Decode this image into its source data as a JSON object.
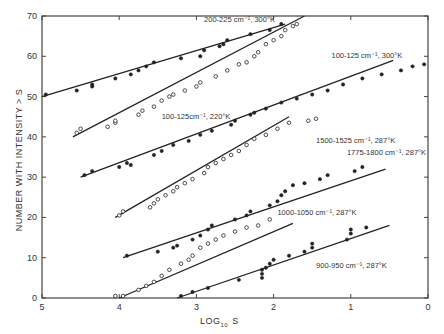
{
  "chart_data": {
    "type": "scatter",
    "title": "",
    "xlabel": "LOG₁₀ S",
    "xlabel_main": "LOG",
    "xlabel_sub": "10",
    "xlabel_tail": "S",
    "ylabel": "NUMBER WITH INTENSITY > S",
    "xlim": [
      5,
      0
    ],
    "ylim": [
      0,
      70
    ],
    "x_ticks": [
      5,
      4,
      3,
      2,
      1,
      0
    ],
    "y_ticks": [
      0,
      10,
      20,
      30,
      40,
      50,
      60,
      70
    ],
    "grid": false,
    "series": [
      {
        "name": "200-225 cm⁻¹, 300°K",
        "marker": "filled",
        "fit_line": [
          [
            5.0,
            50
          ],
          [
            1.85,
            68
          ]
        ],
        "points": [
          [
            4.95,
            50.5
          ],
          [
            4.55,
            51.5
          ],
          [
            4.35,
            52.5
          ],
          [
            4.35,
            53
          ],
          [
            4.05,
            54.5
          ],
          [
            3.85,
            55.5
          ],
          [
            3.75,
            56.5
          ],
          [
            3.65,
            57.5
          ],
          [
            3.55,
            58.5
          ],
          [
            3.2,
            59.5
          ],
          [
            2.95,
            60
          ],
          [
            2.9,
            61.5
          ],
          [
            2.7,
            62.5
          ],
          [
            2.65,
            63
          ],
          [
            2.6,
            64
          ],
          [
            2.3,
            65.5
          ],
          [
            2.05,
            66.5
          ],
          [
            1.9,
            68
          ]
        ],
        "label": {
          "text": "200-225 cm⁻¹, 300°K",
          "x": 2.9,
          "y": 68.5
        }
      },
      {
        "name": "100-125 cm⁻¹, 300°K",
        "marker": "open",
        "fit_line": [
          [
            4.6,
            40
          ],
          [
            1.6,
            70
          ]
        ],
        "points": [
          [
            4.55,
            41
          ],
          [
            4.5,
            42
          ],
          [
            4.15,
            42.5
          ],
          [
            4.05,
            43.5
          ],
          [
            4.05,
            44
          ],
          [
            3.75,
            45.5
          ],
          [
            3.7,
            46.5
          ],
          [
            3.55,
            47.5
          ],
          [
            3.45,
            49
          ],
          [
            3.35,
            50
          ],
          [
            3.3,
            50.5
          ],
          [
            3.15,
            51.5
          ],
          [
            3.0,
            52.5
          ],
          [
            2.95,
            53.5
          ],
          [
            2.75,
            55
          ],
          [
            2.6,
            56.5
          ],
          [
            2.45,
            58
          ],
          [
            2.35,
            58.5
          ],
          [
            2.25,
            60
          ],
          [
            2.2,
            61
          ],
          [
            2.1,
            63
          ],
          [
            2.0,
            64
          ],
          [
            1.9,
            65
          ],
          [
            1.85,
            66.5
          ],
          [
            1.75,
            67.5
          ],
          [
            1.7,
            68
          ]
        ],
        "label": {
          "text": "100-125 cm⁻¹, 300°K",
          "x": 1.25,
          "y": 59.5
        }
      },
      {
        "name": "100-125 cm⁻¹, 220°K",
        "marker": "filled",
        "fit_line": [
          [
            4.5,
            30
          ],
          [
            0.45,
            59
          ]
        ],
        "points": [
          [
            4.45,
            30.5
          ],
          [
            4.35,
            31.5
          ],
          [
            4.0,
            32.5
          ],
          [
            3.9,
            33.5
          ],
          [
            3.85,
            33
          ],
          [
            3.55,
            35.5
          ],
          [
            3.45,
            36.5
          ],
          [
            3.3,
            38
          ],
          [
            3.1,
            39
          ],
          [
            2.95,
            40.5
          ],
          [
            2.8,
            41.5
          ],
          [
            2.55,
            43
          ],
          [
            2.5,
            44
          ],
          [
            2.3,
            45.5
          ],
          [
            2.25,
            46
          ],
          [
            2.1,
            47
          ],
          [
            1.9,
            48.5
          ],
          [
            1.7,
            49.5
          ],
          [
            1.5,
            50.5
          ],
          [
            1.3,
            51.5
          ],
          [
            1.1,
            53
          ],
          [
            0.85,
            54.5
          ],
          [
            0.6,
            55.5
          ],
          [
            0.35,
            56.5
          ],
          [
            0.2,
            57.5
          ],
          [
            0.05,
            58
          ]
        ],
        "label": {
          "text": "100-125cm⁻¹, 220°K",
          "x": 3.45,
          "y": 44.5
        }
      },
      {
        "name": "1500-1525 cm⁻¹, 287°K",
        "marker": "open",
        "fit_line": [
          [
            4.05,
            20
          ],
          [
            1.8,
            45
          ]
        ],
        "points": [
          [
            4.0,
            20.5
          ],
          [
            3.95,
            21.5
          ],
          [
            3.6,
            22.5
          ],
          [
            3.55,
            23.5
          ],
          [
            3.5,
            24.5
          ],
          [
            3.4,
            25.5
          ],
          [
            3.3,
            26.5
          ],
          [
            3.25,
            27.5
          ],
          [
            3.15,
            28.5
          ],
          [
            3.05,
            29.5
          ],
          [
            2.9,
            31
          ],
          [
            2.85,
            32.5
          ],
          [
            2.75,
            33.5
          ],
          [
            2.65,
            34.5
          ],
          [
            2.55,
            35.5
          ],
          [
            2.45,
            36.5
          ],
          [
            2.35,
            38
          ],
          [
            2.25,
            39.5
          ],
          [
            2.1,
            40.5
          ],
          [
            1.95,
            42
          ],
          [
            1.8,
            43.5
          ],
          [
            1.55,
            44
          ],
          [
            1.45,
            44.5
          ]
        ],
        "label": {
          "text": "1500-1525 cm⁻¹, 287°K",
          "x": 1.45,
          "y": 38.5
        }
      },
      {
        "name": "1775-1800 cm⁻¹, 287°K",
        "marker": "filled",
        "fit_line": [
          [
            3.95,
            10
          ],
          [
            0.55,
            32
          ]
        ],
        "points": [
          [
            3.9,
            10.5
          ],
          [
            3.5,
            11.5
          ],
          [
            3.3,
            12.5
          ],
          [
            3.25,
            13
          ],
          [
            3.05,
            14.5
          ],
          [
            2.95,
            15.5
          ],
          [
            2.85,
            17
          ],
          [
            2.8,
            18
          ],
          [
            2.5,
            19.5
          ],
          [
            2.35,
            20.5
          ],
          [
            2.3,
            21.5
          ],
          [
            2.05,
            23
          ],
          [
            1.95,
            24
          ],
          [
            1.9,
            25.5
          ],
          [
            1.85,
            26.5
          ],
          [
            1.75,
            28
          ],
          [
            1.6,
            28.5
          ],
          [
            1.4,
            29.5
          ],
          [
            1.3,
            30.5
          ],
          [
            0.95,
            31.5
          ],
          [
            0.85,
            32.5
          ]
        ],
        "label": {
          "text": "1775-1800 cm⁻¹, 287°K",
          "x": 1.05,
          "y": 35.5
        }
      },
      {
        "name": "1000-1050 cm⁻¹, 287°K",
        "marker": "open",
        "fit_line": [
          [
            4.0,
            0
          ],
          [
            1.75,
            18.5
          ]
        ],
        "points": [
          [
            4.05,
            0.5
          ],
          [
            3.95,
            0.5
          ],
          [
            3.75,
            2
          ],
          [
            3.65,
            3
          ],
          [
            3.55,
            4
          ],
          [
            3.45,
            5.5
          ],
          [
            3.35,
            7
          ],
          [
            3.2,
            8.5
          ],
          [
            3.1,
            9.5
          ],
          [
            3.05,
            10.5
          ],
          [
            2.95,
            12.5
          ],
          [
            2.85,
            13.5
          ],
          [
            2.75,
            14.5
          ],
          [
            2.65,
            15.5
          ],
          [
            2.5,
            16.5
          ],
          [
            2.35,
            17.5
          ],
          [
            2.2,
            18
          ],
          [
            2.05,
            19.5
          ]
        ],
        "label": {
          "text": "1000-1050 cm⁻¹, 287°K",
          "x": 1.95,
          "y": 20.5
        }
      },
      {
        "name": "900-950 cm⁻¹, 287°K",
        "marker": "filled",
        "fit_line": [
          [
            3.25,
            0
          ],
          [
            0.5,
            18
          ]
        ],
        "points": [
          [
            3.2,
            0.5
          ],
          [
            3.05,
            1.5
          ],
          [
            2.85,
            2.5
          ],
          [
            2.45,
            4.5
          ],
          [
            2.15,
            5
          ],
          [
            2.15,
            6
          ],
          [
            2.15,
            7
          ],
          [
            2.1,
            7.5
          ],
          [
            2.05,
            8.5
          ],
          [
            2.0,
            9.5
          ],
          [
            1.8,
            10.5
          ],
          [
            1.6,
            11.5
          ],
          [
            1.5,
            12.5
          ],
          [
            1.5,
            13.5
          ],
          [
            1.05,
            14.5
          ],
          [
            1.0,
            16
          ],
          [
            1.0,
            17
          ],
          [
            0.8,
            17.5
          ]
        ],
        "label": {
          "text": "900-950 cm⁻¹, 287°K",
          "x": 1.45,
          "y": 7.5
        }
      }
    ]
  },
  "colors": {
    "axis": "#444444",
    "line": "#222222",
    "point": "#222222",
    "text": "#333333",
    "background": "#ffffff"
  }
}
